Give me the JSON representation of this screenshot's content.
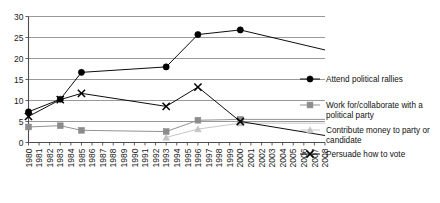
{
  "chart_data": {
    "type": "line",
    "title": "",
    "xlabel": "",
    "ylabel": "",
    "ylim": [
      0,
      30
    ],
    "ytick_step": 5,
    "yticks": [
      "0",
      "5",
      "10",
      "15",
      "20",
      "25",
      "30"
    ],
    "grid": true,
    "legend_position": "right",
    "xlim": [
      1980,
      2008
    ],
    "categories": [
      "1980",
      "1981",
      "1982",
      "1983",
      "1984",
      "1985",
      "1986",
      "1987",
      "1988",
      "1989",
      "1990",
      "1991",
      "1992",
      "1993",
      "1994",
      "1995",
      "1996",
      "1997",
      "1998",
      "1999",
      "2000",
      "2001",
      "2002",
      "2003",
      "2004",
      "2005",
      "2006",
      "2007",
      "2008"
    ],
    "series": [
      {
        "name": "Attend political rallies",
        "marker": "circle",
        "color": "#000000",
        "x": [
          1980,
          1983,
          1985,
          1993,
          1996,
          2000
        ],
        "values": [
          7.3,
          10.3,
          16.7,
          18.0,
          25.7,
          26.8
        ]
      },
      {
        "name": "Work for/collaborate with a political party",
        "marker": "square",
        "color": "#8c8c8c",
        "x": [
          1980,
          1983,
          1985,
          1993,
          1996,
          2000
        ],
        "values": [
          3.7,
          4.0,
          2.9,
          2.6,
          5.3,
          5.5
        ]
      },
      {
        "name": "Contribute money to party or candidate",
        "marker": "triangle",
        "color": "#c4c4c4",
        "x": [
          1993,
          1996,
          2000
        ],
        "values": [
          1.2,
          3.2,
          4.6
        ]
      },
      {
        "name": "Persuade how to vote",
        "marker": "x",
        "color": "#000000",
        "x": [
          1980,
          1983,
          1985,
          1993,
          1996,
          2000
        ],
        "values": [
          6.2,
          10.2,
          11.7,
          8.6,
          13.2,
          5.0
        ]
      }
    ]
  },
  "legend": {
    "items": [
      {
        "label": "Attend political rallies"
      },
      {
        "label": "Work for/collaborate with a political party"
      },
      {
        "label": "Contribute money to party or candidate"
      },
      {
        "label": "Persuade how to vote"
      }
    ]
  }
}
